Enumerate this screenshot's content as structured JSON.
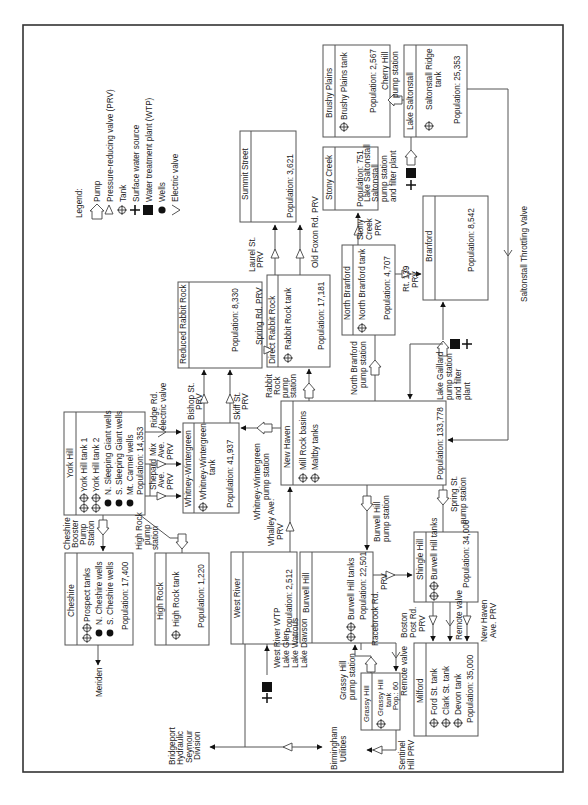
{
  "legend": {
    "title": "Legend:",
    "items": [
      {
        "icon": "pump-icon",
        "label": "Pump"
      },
      {
        "icon": "prv-triangle-icon",
        "label": "Pressure-reducing valve (PRV)"
      },
      {
        "icon": "tank-icon",
        "label": "Tank"
      },
      {
        "icon": "surface-water-plus-icon",
        "label": "Surface water source"
      },
      {
        "icon": "wtp-square-icon",
        "label": "Water treatment plant (WTP)"
      },
      {
        "icon": "well-dot-icon",
        "label": "Wells"
      },
      {
        "icon": "electric-valve-chevron-icon",
        "label": "Electric valve"
      }
    ]
  },
  "zones": {
    "summit_street": {
      "name": "Summit Street",
      "population": "Population: 3,621"
    },
    "brushy_plains": {
      "name": "Brushy Plains",
      "tank": "Brushy Plains tank",
      "population": "Population: 2,567"
    },
    "lake_saltonstall": {
      "name": "Lake Saltonstall",
      "tank": "Saltonstall Ridge",
      "tank2": "tank",
      "population": "Population: 25,353"
    },
    "stony_creek": {
      "name": "Stony Creek",
      "population": "Population: 751"
    },
    "branford": {
      "name": "Branford",
      "population": "Population: 8,542"
    },
    "reduced_rabbit_rock": {
      "name": "Reduced Rabbit Rock",
      "population": "Population: 8,330"
    },
    "direct_rabbit_rock": {
      "name": "Direct Rabbit Rock",
      "tank": "Rabbit Rock tank",
      "population": "Population: 17,181"
    },
    "north_branford": {
      "name": "North Branford",
      "tank": "North Branford tank",
      "population": "Population: 4,707"
    },
    "york_hill": {
      "name": "York Hill",
      "items": [
        "York Hill tank 1",
        "York Hill tank 2",
        "N. Sleeping Giant wells",
        "S. Sleeping Giant wells",
        "Mt. Carmel wells"
      ],
      "population": "Population: 14,353"
    },
    "whitney_wintergreen": {
      "name": "Whitney-Wintergreen",
      "tank": "Whitney-Wintergreen",
      "tank2": "tank",
      "population": "Population: 41,937"
    },
    "new_haven": {
      "name": "New Haven",
      "items": [
        "Mill Rock basins",
        "Maltby tanks"
      ],
      "population": "Population: 133,778"
    },
    "cheshire": {
      "name": "Cheshire",
      "items": [
        "Prospect tanks",
        "N. Cheshire wells",
        "S. Cheshire wells"
      ],
      "population": "Population: 17,400"
    },
    "high_rock": {
      "name": "High Rock",
      "tank": "High Rock tank",
      "population": "Population: 1,220"
    },
    "west_river": {
      "name": "West River",
      "population": "Population: 2,512"
    },
    "burwell_hill": {
      "name": "Burwell Hill",
      "tank": "Burwell Hill tanks",
      "population": "Population: 22,501"
    },
    "shingle_hill": {
      "name": "Shingle Hill",
      "tank": "Burwell Hill tanks",
      "population": "Population: 34,000"
    },
    "milford": {
      "name": "Milford",
      "items": [
        "Ford St. tank",
        "Clark St. tank",
        "Devon tank"
      ],
      "population": "Population: 35,000"
    },
    "grassy_hill": {
      "name": "Grassy Hill",
      "tank": "Grassy Hill",
      "tank2": "tank",
      "population": "Pop.: 60"
    }
  },
  "labels": {
    "laurel_prv": [
      "Laurel St.",
      "PRV"
    ],
    "old_foxon_prv": "Old Foxon Rd. PRV",
    "cherry_hill": [
      "Cherry Hill",
      "pump station"
    ],
    "lake_saltonstall_plant": [
      "Lake Saltonstall",
      "Saltonstall",
      "pump station",
      "and filter plant"
    ],
    "stony_creek_prv": [
      "Stony",
      "Creek",
      "PRV"
    ],
    "rt139_prv": [
      "Rt. 139",
      "PRV"
    ],
    "spring_rd_prv": "Spring Rd. PRV",
    "bishop_prv": [
      "Bishop St.",
      "PRV"
    ],
    "skiff_prv": [
      "Skiff St.",
      "PRV"
    ],
    "rabbit_rock_pump": [
      "Rabbit",
      "Rock",
      "pump",
      "station"
    ],
    "north_branford_pump": [
      "North Branford",
      "pump station"
    ],
    "lake_gaillard": [
      "Lake Gaillard",
      "pump station",
      "and filter",
      "plant"
    ],
    "saltonstall_throttling": "Saltonstall Throttling Valve",
    "ridge_rd": [
      "Ridge Rd.",
      "electric valve"
    ],
    "mix_ave_prv": [
      "Mix",
      "Ave.",
      "PRV"
    ],
    "shepard_ave_prv": [
      "Shepard",
      "Ave.",
      "PRV"
    ],
    "ww_pump": [
      "Whitney-Wintergreen",
      "pump station"
    ],
    "whalley_prv": [
      "Whalley Ave.",
      "PRV"
    ],
    "burwell_pump": [
      "Burwell Hill",
      "pump station"
    ],
    "spring_st_pump": [
      "Spring St.",
      "pump station"
    ],
    "cheshire_booster": [
      "Cheshire",
      "Booster",
      "Pump",
      "Station"
    ],
    "high_rock_pump": [
      "High Rock",
      "pump",
      "station"
    ],
    "meriden": "Meriden",
    "west_river_wtp": [
      "West River WTP",
      "Lake Glen",
      "Lake Watrous",
      "Lake Dawson"
    ],
    "bridgeport": [
      "Bridgeport",
      "Hydraulic",
      "Seymour",
      "Division"
    ],
    "birmingham": [
      "Birmingham",
      "Utilities"
    ],
    "racebrook_prv": [
      "Racebrook Rd.",
      "PRV"
    ],
    "grassy_hill_pump": [
      "Grassy Hill",
      "pump station"
    ],
    "remote_valve_left": "Remote valve",
    "boston_post_prv": [
      "Boston",
      "Post Rd.",
      "PRV"
    ],
    "remote_valve_right": "Remote valve",
    "new_haven_ave_prv": [
      "New Haven",
      "Ave. PRV"
    ],
    "sentinel_prv": [
      "Sentinel",
      "Hill PRV"
    ]
  }
}
